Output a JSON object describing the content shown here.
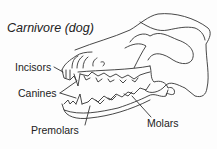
{
  "title": "Carnivore (dog)",
  "labels": {
    "incisors": "Incisors",
    "canines": "Canines",
    "premolars": "Premolars",
    "molars": "Molars"
  }
}
